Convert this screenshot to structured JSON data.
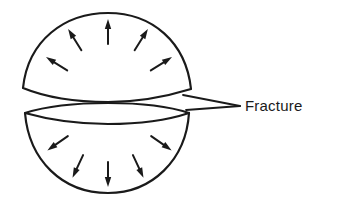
{
  "diagram": {
    "label": "Fracture",
    "colors": {
      "stroke": "#1a1a1a",
      "background": "#ffffff"
    },
    "top_hemisphere": {
      "arrow_count": 5,
      "arrow_direction": "outward-up"
    },
    "bottom_hemisphere": {
      "arrow_count": 5,
      "arrow_direction": "outward-down"
    }
  }
}
